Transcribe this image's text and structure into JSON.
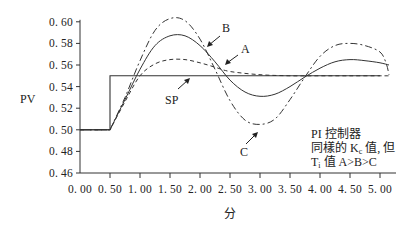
{
  "chart_data": {
    "type": "line",
    "title": "",
    "xlabel": "分",
    "ylabel": "PV",
    "xlim": [
      0.0,
      5.0
    ],
    "ylim": [
      0.46,
      0.6
    ],
    "grid": false,
    "legend": "none (curves labeled directly with arrows)",
    "x_ticks": [
      "0. 00",
      "0. 50",
      "1. 00",
      "1. 50",
      "2. 00",
      "2. 50",
      "3. 00",
      "3. 50",
      "4. 00",
      "4. 50",
      "5. 00"
    ],
    "y_ticks": [
      "0. 60",
      "0. 58",
      "0. 56",
      "0. 54",
      "0. 52",
      "0. 50",
      "0. 48",
      "0. 46"
    ],
    "annotation": [
      "PI 控制器",
      "同樣的 Kc 值, 但",
      "Ti 值 A>B>C"
    ],
    "series": [
      {
        "name": "SP",
        "style": "solid",
        "x": [
          0.0,
          0.5,
          0.5,
          5.0
        ],
        "y": [
          0.5,
          0.5,
          0.55,
          0.55
        ]
      },
      {
        "name": "A",
        "style": "dashed",
        "x": [
          0.0,
          0.5,
          0.75,
          1.0,
          1.25,
          1.5,
          1.75,
          2.0,
          2.25,
          2.5,
          3.0,
          3.5,
          4.0,
          4.5,
          5.0,
          5.15
        ],
        "y": [
          0.5,
          0.5,
          0.526,
          0.55,
          0.561,
          0.565,
          0.565,
          0.562,
          0.558,
          0.554,
          0.551,
          0.55,
          0.55,
          0.55,
          0.55,
          0.55
        ]
      },
      {
        "name": "B",
        "style": "solid",
        "x": [
          0.0,
          0.5,
          0.75,
          1.0,
          1.25,
          1.5,
          1.75,
          2.0,
          2.25,
          2.5,
          2.75,
          3.0,
          3.25,
          3.5,
          3.75,
          4.0,
          4.25,
          4.5,
          4.75,
          5.0,
          5.15
        ],
        "y": [
          0.5,
          0.5,
          0.528,
          0.556,
          0.578,
          0.587,
          0.587,
          0.578,
          0.563,
          0.546,
          0.535,
          0.531,
          0.533,
          0.54,
          0.549,
          0.557,
          0.563,
          0.565,
          0.564,
          0.562,
          0.56
        ]
      },
      {
        "name": "C",
        "style": "dash-dot",
        "x": [
          0.0,
          0.5,
          0.75,
          1.0,
          1.25,
          1.5,
          1.75,
          2.0,
          2.25,
          2.5,
          2.75,
          3.0,
          3.25,
          3.5,
          3.75,
          4.0,
          4.25,
          4.5,
          4.75,
          5.0,
          5.1,
          5.15
        ],
        "y": [
          0.5,
          0.5,
          0.53,
          0.564,
          0.592,
          0.603,
          0.601,
          0.584,
          0.556,
          0.527,
          0.509,
          0.505,
          0.51,
          0.528,
          0.549,
          0.568,
          0.578,
          0.58,
          0.578,
          0.572,
          0.562,
          0.551
        ]
      }
    ]
  },
  "labels": {
    "sp": "SP",
    "a": "A",
    "b": "B",
    "c": "C",
    "ylabel": "PV",
    "xlabel": "分",
    "note_line1": "PI 控制器",
    "note_line2_prefix": "同樣的 K",
    "note_line2_sub": "c",
    "note_line2_suffix": " 值, 但",
    "note_line3_prefix": "T",
    "note_line3_sub": "i",
    "note_line3_suffix": " 值 A>B>C"
  }
}
